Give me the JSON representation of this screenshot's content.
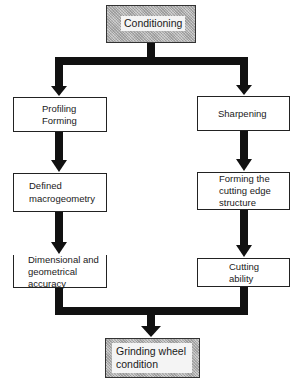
{
  "diagram": {
    "type": "flowchart",
    "root": {
      "id": "conditioning",
      "label": "Conditioning"
    },
    "left_branch": [
      {
        "id": "profiling-forming",
        "line1": "Profiling",
        "line2": "Forming"
      },
      {
        "id": "defined-macrogeometry",
        "line1": "Defined",
        "line2": "macrogeometry"
      },
      {
        "id": "dimensional-accuracy",
        "line1": "Dimensional and",
        "line2": "geometrical",
        "line3": "accuracy"
      }
    ],
    "right_branch": [
      {
        "id": "sharpening",
        "line1": "Sharpening"
      },
      {
        "id": "forming-cutting-edge",
        "line1": "Forming the",
        "line2": "cutting edge",
        "line3": "structure"
      },
      {
        "id": "cutting-ability",
        "line1": "Cutting",
        "line2": "ability"
      }
    ],
    "result": {
      "id": "grinding-wheel-condition",
      "line1": "Grinding wheel",
      "line2": "condition"
    },
    "edges": [
      [
        "conditioning",
        "profiling-forming"
      ],
      [
        "conditioning",
        "sharpening"
      ],
      [
        "profiling-forming",
        "defined-macrogeometry"
      ],
      [
        "defined-macrogeometry",
        "dimensional-accuracy"
      ],
      [
        "sharpening",
        "forming-cutting-edge"
      ],
      [
        "forming-cutting-edge",
        "cutting-ability"
      ],
      [
        "dimensional-accuracy",
        "grinding-wheel-condition"
      ],
      [
        "cutting-ability",
        "grinding-wheel-condition"
      ]
    ],
    "colors": {
      "arrow": "#111111",
      "box_border": "#222222",
      "hatch_fill": "#bdbdbd"
    }
  }
}
